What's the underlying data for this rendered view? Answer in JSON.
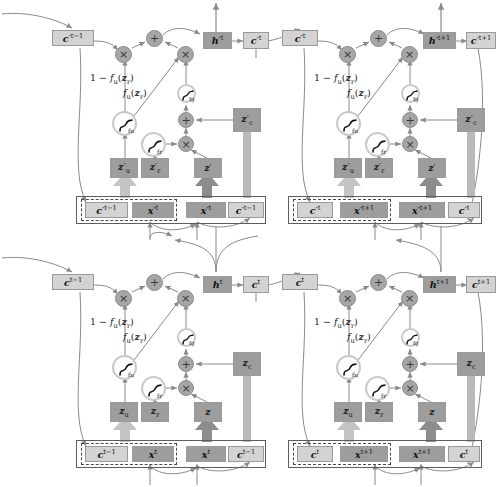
{
  "diagram": {
    "type": "neural-network-computation-graph",
    "colors": {
      "box_dark": "#9d9d9d",
      "box_light": "#d3d3d3",
      "operator_circle": "#a6a6a6",
      "activation_ring": "#c9c9c9",
      "wire": "#8a8a8a",
      "thick_arrow": "#b8b8b8",
      "dark_arrow": "#8c8c8c",
      "frame": "#5d5d5d",
      "text": "#111111",
      "background": "#ffffff"
    },
    "operators": {
      "multiply": "×",
      "add": "+"
    },
    "labels": {
      "one_minus_fu": "1 − f_u(z_r)",
      "fu_zr": "f_u(z_r)"
    },
    "activations": [
      {
        "name": "f_u",
        "symbol": "∫",
        "subscript": "f_u"
      },
      {
        "name": "f_r",
        "symbol": "∫",
        "subscript": "f_r"
      },
      {
        "name": "f_g",
        "symbol": "∫",
        "subscript": "f_g"
      }
    ],
    "blocks": [
      {
        "id": "top-left",
        "layer": "upper",
        "time": "t",
        "state_in": "c′t−1",
        "hidden_out": "h′t",
        "state_out": "c′t",
        "gates": {
          "update": "z′u",
          "reset": "z′r",
          "candidate": "z′",
          "cell": "z′c"
        },
        "inputs": {
          "prev_state": "c′t−1",
          "observation": "x′t",
          "observation2": "x′t",
          "prev_state2": "c′t−1"
        }
      },
      {
        "id": "top-right",
        "layer": "upper",
        "time": "t+1",
        "state_in": "c′t",
        "hidden_out": "h′t+1",
        "state_out": "c′t+1",
        "gates": {
          "update": "z′u",
          "reset": "z′r",
          "candidate": "z′",
          "cell": "z′c"
        },
        "inputs": {
          "prev_state": "c′t",
          "observation": "x′t+1",
          "observation2": "x′t+1",
          "prev_state2": "c′t"
        }
      },
      {
        "id": "bottom-left",
        "layer": "lower",
        "time": "t",
        "state_in": "ct−1",
        "hidden_out": "ht",
        "state_out": "ct",
        "gates": {
          "update": "zu",
          "reset": "zr",
          "candidate": "z",
          "cell": "zc"
        },
        "inputs": {
          "prev_state": "ct−1",
          "observation": "xt",
          "observation2": "xt",
          "prev_state2": "ct−1"
        }
      },
      {
        "id": "bottom-right",
        "layer": "lower",
        "time": "t+1",
        "state_in": "ct",
        "hidden_out": "ht+1",
        "state_out": "ct+1",
        "gates": {
          "update": "zu",
          "reset": "zr",
          "candidate": "z",
          "cell": "zc"
        },
        "inputs": {
          "prev_state": "ct",
          "observation": "xt+1",
          "observation2": "xt+1",
          "prev_state2": "ct"
        }
      }
    ],
    "text": {
      "tl": {
        "c_prev": "c′t−1",
        "h_out": "h′t",
        "c_out": "c′t",
        "zu": "z′u",
        "zr": "z′r",
        "z": "z′",
        "zc": "z′c",
        "in_c": "c′t−1",
        "in_x": "x′t",
        "in_x2": "x′t",
        "in_c2": "c′t−1"
      },
      "tr": {
        "c_prev": "c′t",
        "h_out": "h′t+1",
        "c_out": "c′t+1",
        "zu": "z′u",
        "zr": "z′r",
        "z": "z′",
        "zc": "z′c",
        "in_c": "c′t",
        "in_x": "x′t+1",
        "in_x2": "x′t+1",
        "in_c2": "c′t"
      },
      "bl": {
        "c_prev": "ct−1",
        "h_out": "ht",
        "c_out": "ct",
        "zu": "zu",
        "zr": "zr",
        "z": "z",
        "zc": "zc",
        "in_c": "ct−1",
        "in_x": "xt",
        "in_x2": "xt",
        "in_c2": "ct−1"
      },
      "br": {
        "c_prev": "ct",
        "h_out": "ht+1",
        "c_out": "ct+1",
        "zu": "zu",
        "zr": "zr",
        "z": "z",
        "zc": "zc",
        "in_c": "ct",
        "in_x": "xt+1",
        "in_x2": "xt+1",
        "in_c2": "ct"
      }
    }
  }
}
